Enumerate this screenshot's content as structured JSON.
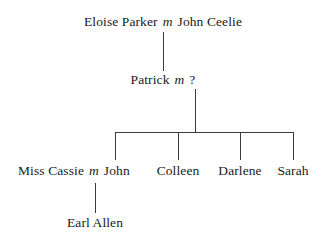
{
  "diagram": {
    "type": "genealogy-chart",
    "background_color": "#ffffff",
    "line_color": "#3b3b3b",
    "text_color": "#1a1a1a",
    "marriage_symbol": "m",
    "unknown_symbol": "?"
  },
  "generations": {
    "gen1": {
      "label": "Generation 1",
      "couple": {
        "person_left": "Eloise Parker",
        "marriage_symbol": "m",
        "person_right": "John Ceelie"
      }
    },
    "gen2": {
      "label": "Generation 2",
      "couple": {
        "person_left": "Patrick",
        "marriage_symbol": "m",
        "person_right": "?"
      }
    },
    "gen3": {
      "label": "Generation 3",
      "spouse_of_first_child": "Miss Cassie",
      "marriage_symbol": "m",
      "children": [
        {
          "name": "John"
        },
        {
          "name": "Colleen"
        },
        {
          "name": "Darlene"
        },
        {
          "name": "Sarah"
        }
      ]
    },
    "gen4": {
      "label": "Generation 4",
      "children": [
        {
          "name": "Earl Allen"
        }
      ]
    }
  }
}
